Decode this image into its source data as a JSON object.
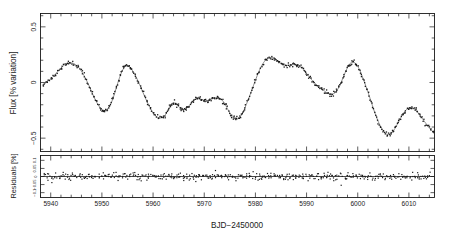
{
  "figure": {
    "name": "stellar-light-curve-figure",
    "background_color": "#ffffff",
    "ink_color": "#1a1a1a",
    "curve_color": "#555555"
  },
  "chart_data": {
    "type": "line",
    "title": "",
    "subtitle": "",
    "xlabel": "BJD-2450000",
    "xlabel_display": "BJD−2450000",
    "grid": false,
    "legend": "none",
    "panels": [
      {
        "name": "flux-panel",
        "ylabel": "Flux [% variation]",
        "ylim": [
          -0.62,
          0.62
        ],
        "xlim": [
          5938,
          6015
        ],
        "ytick_values": [
          0.5,
          0,
          -0.5
        ],
        "ytick_labels": [
          "0.5",
          "0",
          "−0.5"
        ],
        "ytick_minor_step": 0.1,
        "series": [
          {
            "name": "observed flux",
            "marker": "dot",
            "style": "points"
          },
          {
            "name": "spot model fit",
            "marker": "none",
            "style": "line"
          }
        ],
        "model_points": [
          [
            5938.5,
            -0.03
          ],
          [
            5939.3,
            0.01
          ],
          [
            5940.2,
            0.04
          ],
          [
            5941.0,
            0.08
          ],
          [
            5941.8,
            0.12
          ],
          [
            5942.6,
            0.155
          ],
          [
            5943.4,
            0.175
          ],
          [
            5944.2,
            0.175
          ],
          [
            5945.0,
            0.155
          ],
          [
            5945.8,
            0.115
          ],
          [
            5946.6,
            0.055
          ],
          [
            5947.4,
            -0.02
          ],
          [
            5948.2,
            -0.105
          ],
          [
            5949.0,
            -0.18
          ],
          [
            5949.8,
            -0.235
          ],
          [
            5950.3,
            -0.25
          ],
          [
            5950.9,
            -0.245
          ],
          [
            5951.6,
            -0.205
          ],
          [
            5952.3,
            -0.125
          ],
          [
            5953.0,
            -0.02
          ],
          [
            5953.7,
            0.075
          ],
          [
            5954.3,
            0.13
          ],
          [
            5954.9,
            0.15
          ],
          [
            5955.5,
            0.135
          ],
          [
            5956.2,
            0.09
          ],
          [
            5957.0,
            0.02
          ],
          [
            5957.8,
            -0.065
          ],
          [
            5958.6,
            -0.15
          ],
          [
            5959.4,
            -0.225
          ],
          [
            5960.2,
            -0.285
          ],
          [
            5961.0,
            -0.315
          ],
          [
            5961.8,
            -0.315
          ],
          [
            5962.4,
            -0.29
          ],
          [
            5963.0,
            -0.24
          ],
          [
            5963.6,
            -0.195
          ],
          [
            5964.2,
            -0.185
          ],
          [
            5964.8,
            -0.205
          ],
          [
            5965.4,
            -0.235
          ],
          [
            5966.0,
            -0.245
          ],
          [
            5966.6,
            -0.23
          ],
          [
            5967.3,
            -0.195
          ],
          [
            5968.0,
            -0.16
          ],
          [
            5968.7,
            -0.145
          ],
          [
            5969.3,
            -0.15
          ],
          [
            5969.9,
            -0.16
          ],
          [
            5970.5,
            -0.165
          ],
          [
            5971.2,
            -0.155
          ],
          [
            5971.9,
            -0.14
          ],
          [
            5972.6,
            -0.135
          ],
          [
            5973.3,
            -0.15
          ],
          [
            5974.0,
            -0.19
          ],
          [
            5974.7,
            -0.25
          ],
          [
            5975.4,
            -0.305
          ],
          [
            5976.1,
            -0.33
          ],
          [
            5976.8,
            -0.32
          ],
          [
            5977.5,
            -0.275
          ],
          [
            5978.2,
            -0.2
          ],
          [
            5979.0,
            -0.105
          ],
          [
            5979.8,
            -0.005
          ],
          [
            5980.6,
            0.09
          ],
          [
            5981.4,
            0.165
          ],
          [
            5982.2,
            0.21
          ],
          [
            5983.0,
            0.225
          ],
          [
            5983.8,
            0.215
          ],
          [
            5984.5,
            0.19
          ],
          [
            5985.2,
            0.165
          ],
          [
            5985.9,
            0.155
          ],
          [
            5986.6,
            0.155
          ],
          [
            5987.3,
            0.16
          ],
          [
            5988.0,
            0.16
          ],
          [
            5988.7,
            0.145
          ],
          [
            5989.4,
            0.115
          ],
          [
            5990.1,
            0.075
          ],
          [
            5990.8,
            0.035
          ],
          [
            5991.5,
            0.0
          ],
          [
            5992.2,
            -0.03
          ],
          [
            5992.9,
            -0.055
          ],
          [
            5993.6,
            -0.08
          ],
          [
            5994.3,
            -0.1
          ],
          [
            5995.0,
            -0.105
          ],
          [
            5995.7,
            -0.085
          ],
          [
            5996.4,
            -0.035
          ],
          [
            5997.1,
            0.04
          ],
          [
            5997.8,
            0.115
          ],
          [
            5998.4,
            0.165
          ],
          [
            5999.0,
            0.185
          ],
          [
            5999.6,
            0.17
          ],
          [
            6000.3,
            0.12
          ],
          [
            6001.0,
            0.04
          ],
          [
            6001.8,
            -0.06
          ],
          [
            6002.6,
            -0.17
          ],
          [
            6003.4,
            -0.28
          ],
          [
            6004.2,
            -0.37
          ],
          [
            6005.0,
            -0.435
          ],
          [
            6005.7,
            -0.465
          ],
          [
            6006.4,
            -0.46
          ],
          [
            6007.1,
            -0.425
          ],
          [
            6007.8,
            -0.37
          ],
          [
            6008.5,
            -0.31
          ],
          [
            6009.2,
            -0.26
          ],
          [
            6009.9,
            -0.23
          ],
          [
            6010.6,
            -0.225
          ],
          [
            6011.3,
            -0.245
          ],
          [
            6012.0,
            -0.285
          ],
          [
            6012.8,
            -0.335
          ],
          [
            6013.6,
            -0.385
          ],
          [
            6014.4,
            -0.43
          ],
          [
            6015.0,
            -0.455
          ]
        ],
        "curve_segments": [
          {
            "comment": "full model curve sampled across the observing window",
            "x_start": 5938.5,
            "x_end": 6014.6
          }
        ]
      },
      {
        "name": "residuals-panel",
        "ylabel": "Residuals [%]",
        "ylim": [
          -0.13,
          0.13
        ],
        "xlim": [
          5938,
          6015
        ],
        "ytick_values": [
          0.1,
          0.05,
          0,
          -0.05,
          -0.1
        ],
        "ytick_labels": [
          "0.1",
          "0.05",
          "0",
          "−0.05",
          "−0.1"
        ],
        "scatter_rms": 0.02,
        "zero_line": 0
      }
    ],
    "xtick_values": [
      5940,
      5950,
      5960,
      5970,
      5980,
      5990,
      6000,
      6010
    ],
    "xtick_labels": [
      "5940",
      "5950",
      "5960",
      "5970",
      "5980",
      "5990",
      "6000",
      "6010"
    ],
    "xtick_minor_step": 2
  }
}
